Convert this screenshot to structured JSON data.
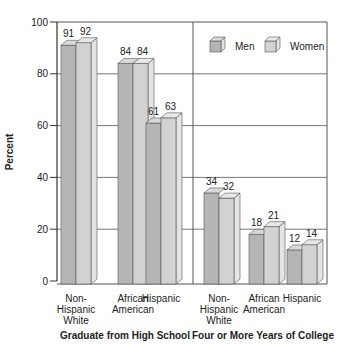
{
  "chart_data": {
    "type": "bar",
    "title": "",
    "ylabel": "Percent",
    "xlabel": "",
    "ylim": [
      0,
      100
    ],
    "yticks": [
      0,
      20,
      40,
      60,
      80,
      100
    ],
    "grid": true,
    "legend_position": "top-right",
    "legend": [
      {
        "name": "Men",
        "color": "#b5b5b5"
      },
      {
        "name": "Women",
        "color": "#d2d2d2"
      }
    ],
    "panels": [
      {
        "title": "Graduate from High School",
        "categories": [
          "Non-Hispanic White",
          "African American",
          "Hispanic"
        ],
        "category_lines": [
          [
            "Non-",
            "Hispanic",
            "White"
          ],
          [
            "African",
            "American"
          ],
          [
            "Hispanic"
          ]
        ],
        "series": [
          {
            "name": "Men",
            "values": [
              91,
              84,
              61
            ]
          },
          {
            "name": "Women",
            "values": [
              92,
              84,
              63
            ]
          }
        ]
      },
      {
        "title": "Four or More Years of College",
        "categories": [
          "Non-Hispanic White",
          "African American",
          "Hispanic"
        ],
        "category_lines": [
          [
            "Non-",
            "Hispanic",
            "White"
          ],
          [
            "African",
            "American"
          ],
          [
            "Hispanic"
          ]
        ],
        "series": [
          {
            "name": "Men",
            "values": [
              34,
              18,
              12
            ]
          },
          {
            "name": "Women",
            "values": [
              32,
              21,
              14
            ]
          }
        ]
      }
    ]
  },
  "colors": {
    "men_front": "#b5b5b5",
    "women_front": "#d2d2d2",
    "side": "#e4e4e4",
    "top_men": "#d8d8d8",
    "top_women": "#e8e8e8",
    "edge": "#555555",
    "axis": "#333333",
    "grid": "#555555"
  }
}
